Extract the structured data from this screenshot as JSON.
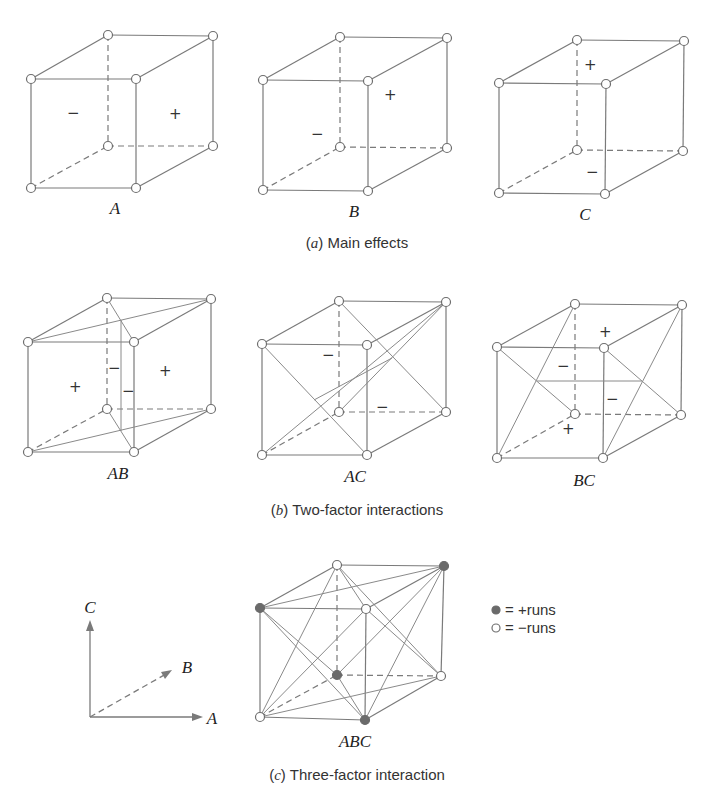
{
  "figure": {
    "sections": [
      {
        "id": "a",
        "caption_letter": "a",
        "caption_text": "Main effects",
        "cubes": [
          {
            "label": "A",
            "signs": [
              "−",
              "+"
            ]
          },
          {
            "label": "B",
            "signs": [
              "−",
              "+"
            ]
          },
          {
            "label": "C",
            "signs": [
              "+",
              "−"
            ]
          }
        ]
      },
      {
        "id": "b",
        "caption_letter": "b",
        "caption_text": "Two-factor interactions",
        "cubes": [
          {
            "label": "AB",
            "signs": [
              "+",
              "−",
              "−",
              "+"
            ]
          },
          {
            "label": "AC",
            "signs": [
              "−",
              "−"
            ]
          },
          {
            "label": "BC",
            "signs": [
              "+",
              "−",
              "−",
              "+"
            ]
          }
        ]
      },
      {
        "id": "c",
        "caption_letter": "c",
        "caption_text": "Three-factor interaction",
        "cubes": [
          {
            "label": "ABC"
          }
        ]
      }
    ],
    "axes": {
      "x_label": "A",
      "y_label": "B",
      "z_label": "C"
    },
    "legend": [
      {
        "marker": "filled-circle",
        "text": "= +runs"
      },
      {
        "marker": "open-circle",
        "text": "= −runs"
      }
    ],
    "colors": {
      "line": "#7a7a7a",
      "filled_vertex": "#6a6a6a",
      "open_vertex": "#ffffff"
    }
  }
}
